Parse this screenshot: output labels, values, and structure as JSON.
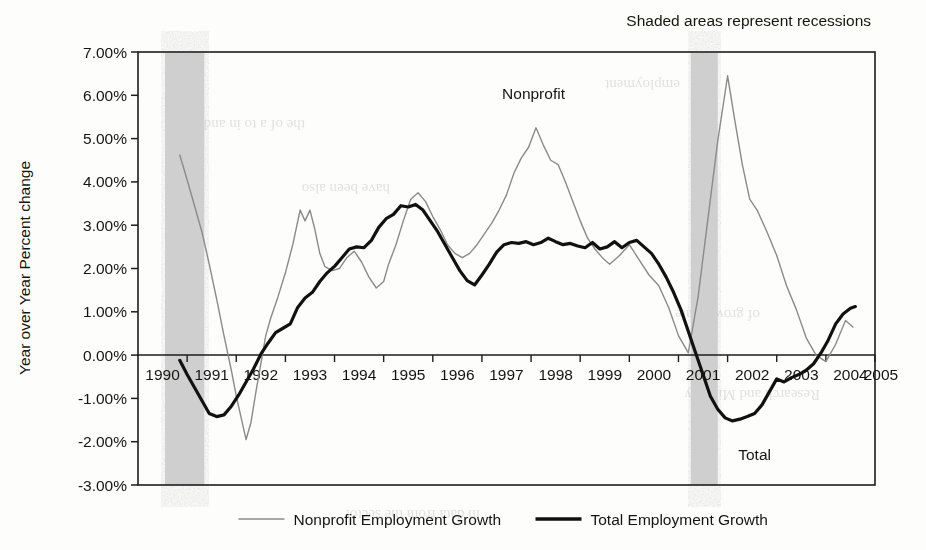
{
  "figure": {
    "note": "Shaded areas represent recessions",
    "background_color": "#fdfdfb",
    "annotations": [
      {
        "text": "Nonprofit",
        "x_year": 1998.05,
        "y_value": 5.92
      },
      {
        "text": "Total",
        "x_year": 2002.55,
        "y_value": -2.42
      }
    ]
  },
  "chart_data": {
    "type": "line",
    "title": "",
    "subtitle": "",
    "note": "Shaded areas represent recessions",
    "xlabel": "",
    "ylabel": "Year over Year Percent change",
    "xlim": [
      1990,
      2005
    ],
    "ylim": [
      -3.0,
      7.0
    ],
    "grid": false,
    "legend_position": "bottom",
    "y_tick_labels": [
      "7.00%",
      "6.00%",
      "5.00%",
      "4.00%",
      "3.00%",
      "2.00%",
      "1.00%",
      "0.00%",
      "-1.00%",
      "-2.00%",
      "-3.00%"
    ],
    "y_tick_values": [
      7,
      6,
      5,
      4,
      3,
      2,
      1,
      0,
      -1,
      -2,
      -3
    ],
    "x_tick_labels": [
      "1990",
      "1991",
      "1992",
      "1993",
      "1994",
      "1995",
      "1996",
      "1997",
      "1998",
      "1999",
      "2000",
      "2001",
      "2002",
      "2003",
      "2004",
      "2005"
    ],
    "x_tick_values": [
      1990,
      1991,
      1992,
      1993,
      1994,
      1995,
      1996,
      1997,
      1998,
      1999,
      2000,
      2001,
      2002,
      2003,
      2004,
      2005
    ],
    "units": "percent",
    "shaded_regions": [
      {
        "label": "recession",
        "x_start": 1990.55,
        "x_end": 1991.35,
        "color": "#cfcfcf"
      },
      {
        "label": "recession",
        "x_start": 2001.25,
        "x_end": 2001.8,
        "color": "#cfcfcf"
      }
    ],
    "series": [
      {
        "name": "Nonprofit Employment Growth",
        "color": "#8a8a8a",
        "width": 1.4,
        "x": [
          1990.85,
          1991.0,
          1991.15,
          1991.3,
          1991.45,
          1991.6,
          1991.75,
          1991.9,
          1992.0,
          1992.1,
          1992.2,
          1992.3,
          1992.4,
          1992.5,
          1992.6,
          1992.7,
          1992.85,
          1993.0,
          1993.15,
          1993.3,
          1993.4,
          1993.5,
          1993.6,
          1993.7,
          1993.8,
          1993.95,
          1994.1,
          1994.25,
          1994.4,
          1994.55,
          1994.7,
          1994.85,
          1995.0,
          1995.1,
          1995.25,
          1995.4,
          1995.55,
          1995.7,
          1995.85,
          1996.0,
          1996.15,
          1996.3,
          1996.45,
          1996.6,
          1996.75,
          1996.9,
          1997.05,
          1997.2,
          1997.35,
          1997.5,
          1997.65,
          1997.8,
          1997.95,
          1998.1,
          1998.25,
          1998.4,
          1998.55,
          1998.7,
          1998.85,
          1999.0,
          1999.15,
          1999.3,
          1999.45,
          1999.6,
          1999.8,
          2000.0,
          2000.2,
          2000.4,
          2000.6,
          2000.8,
          2001.0,
          2001.2,
          2001.4,
          2001.6,
          2001.8,
          2002.0,
          2002.15,
          2002.3,
          2002.45,
          2002.6,
          2002.8,
          2003.0,
          2003.2,
          2003.4,
          2003.6,
          2003.8,
          2004.0,
          2004.2,
          2004.4,
          2004.55
        ],
        "y": [
          4.62,
          4.05,
          3.45,
          2.85,
          2.1,
          1.3,
          0.45,
          -0.35,
          -0.95,
          -1.45,
          -1.95,
          -1.55,
          -0.85,
          -0.2,
          0.45,
          0.85,
          1.35,
          1.9,
          2.55,
          3.35,
          3.1,
          3.35,
          2.9,
          2.35,
          2.05,
          1.95,
          2.0,
          2.25,
          2.4,
          2.15,
          1.8,
          1.55,
          1.7,
          2.1,
          2.55,
          3.1,
          3.6,
          3.75,
          3.55,
          3.2,
          2.9,
          2.55,
          2.35,
          2.25,
          2.35,
          2.55,
          2.8,
          3.05,
          3.35,
          3.7,
          4.2,
          4.55,
          4.8,
          5.25,
          4.85,
          4.5,
          4.4,
          4.0,
          3.55,
          3.1,
          2.7,
          2.45,
          2.25,
          2.1,
          2.3,
          2.55,
          2.2,
          1.85,
          1.6,
          1.1,
          0.45,
          0.05,
          1.35,
          3.15,
          4.95,
          6.45,
          5.4,
          4.4,
          3.6,
          3.35,
          2.85,
          2.3,
          1.6,
          1.05,
          0.4,
          0.0,
          -0.15,
          0.25,
          0.8,
          0.65
        ]
      },
      {
        "name": "Total Employment Growth",
        "color": "#111111",
        "width": 3.2,
        "x": [
          1990.85,
          1991.0,
          1991.15,
          1991.3,
          1991.45,
          1991.6,
          1991.75,
          1991.9,
          1992.05,
          1992.2,
          1992.35,
          1992.5,
          1992.65,
          1992.8,
          1992.95,
          1993.1,
          1993.25,
          1993.4,
          1993.55,
          1993.7,
          1993.85,
          1994.0,
          1994.15,
          1994.3,
          1994.45,
          1994.6,
          1994.75,
          1994.9,
          1995.05,
          1995.2,
          1995.35,
          1995.5,
          1995.65,
          1995.8,
          1995.95,
          1996.1,
          1996.25,
          1996.4,
          1996.55,
          1996.7,
          1996.85,
          1997.0,
          1997.15,
          1997.3,
          1997.45,
          1997.6,
          1997.75,
          1997.9,
          1998.05,
          1998.2,
          1998.35,
          1998.5,
          1998.65,
          1998.8,
          1998.95,
          1999.1,
          1999.25,
          1999.4,
          1999.55,
          1999.7,
          1999.85,
          2000.0,
          2000.15,
          2000.3,
          2000.45,
          2000.6,
          2000.75,
          2000.9,
          2001.05,
          2001.2,
          2001.35,
          2001.5,
          2001.65,
          2001.8,
          2001.95,
          2002.1,
          2002.25,
          2002.4,
          2002.55,
          2002.7,
          2002.85,
          2003.0,
          2003.15,
          2003.3,
          2003.45,
          2003.6,
          2003.75,
          2003.9,
          2004.05,
          2004.2,
          2004.35,
          2004.5,
          2004.6
        ],
        "y": [
          -0.12,
          -0.45,
          -0.75,
          -1.05,
          -1.35,
          -1.42,
          -1.38,
          -1.18,
          -0.92,
          -0.62,
          -0.32,
          0.02,
          0.28,
          0.52,
          0.62,
          0.72,
          1.1,
          1.32,
          1.45,
          1.7,
          1.9,
          2.05,
          2.25,
          2.45,
          2.5,
          2.48,
          2.65,
          2.95,
          3.15,
          3.25,
          3.45,
          3.42,
          3.48,
          3.35,
          3.1,
          2.85,
          2.55,
          2.25,
          1.95,
          1.72,
          1.62,
          1.85,
          2.1,
          2.38,
          2.55,
          2.6,
          2.58,
          2.62,
          2.55,
          2.6,
          2.7,
          2.62,
          2.55,
          2.58,
          2.52,
          2.48,
          2.6,
          2.45,
          2.5,
          2.62,
          2.48,
          2.6,
          2.65,
          2.5,
          2.35,
          2.1,
          1.8,
          1.45,
          1.05,
          0.55,
          0.05,
          -0.45,
          -0.95,
          -1.25,
          -1.45,
          -1.52,
          -1.48,
          -1.42,
          -1.35,
          -1.15,
          -0.85,
          -0.55,
          -0.62,
          -0.52,
          -0.45,
          -0.35,
          -0.2,
          0.05,
          0.35,
          0.72,
          0.95,
          1.08,
          1.12
        ]
      }
    ]
  },
  "legend": {
    "items": [
      {
        "label": "Nonprofit Employment Growth",
        "color": "#8a8a8a",
        "width": 1.6
      },
      {
        "label": "Total Employment Growth",
        "color": "#111111",
        "width": 3.4
      }
    ]
  },
  "ghost_text": {
    "lines": [
      "fragments of reverse-side print visible through paper"
    ]
  }
}
